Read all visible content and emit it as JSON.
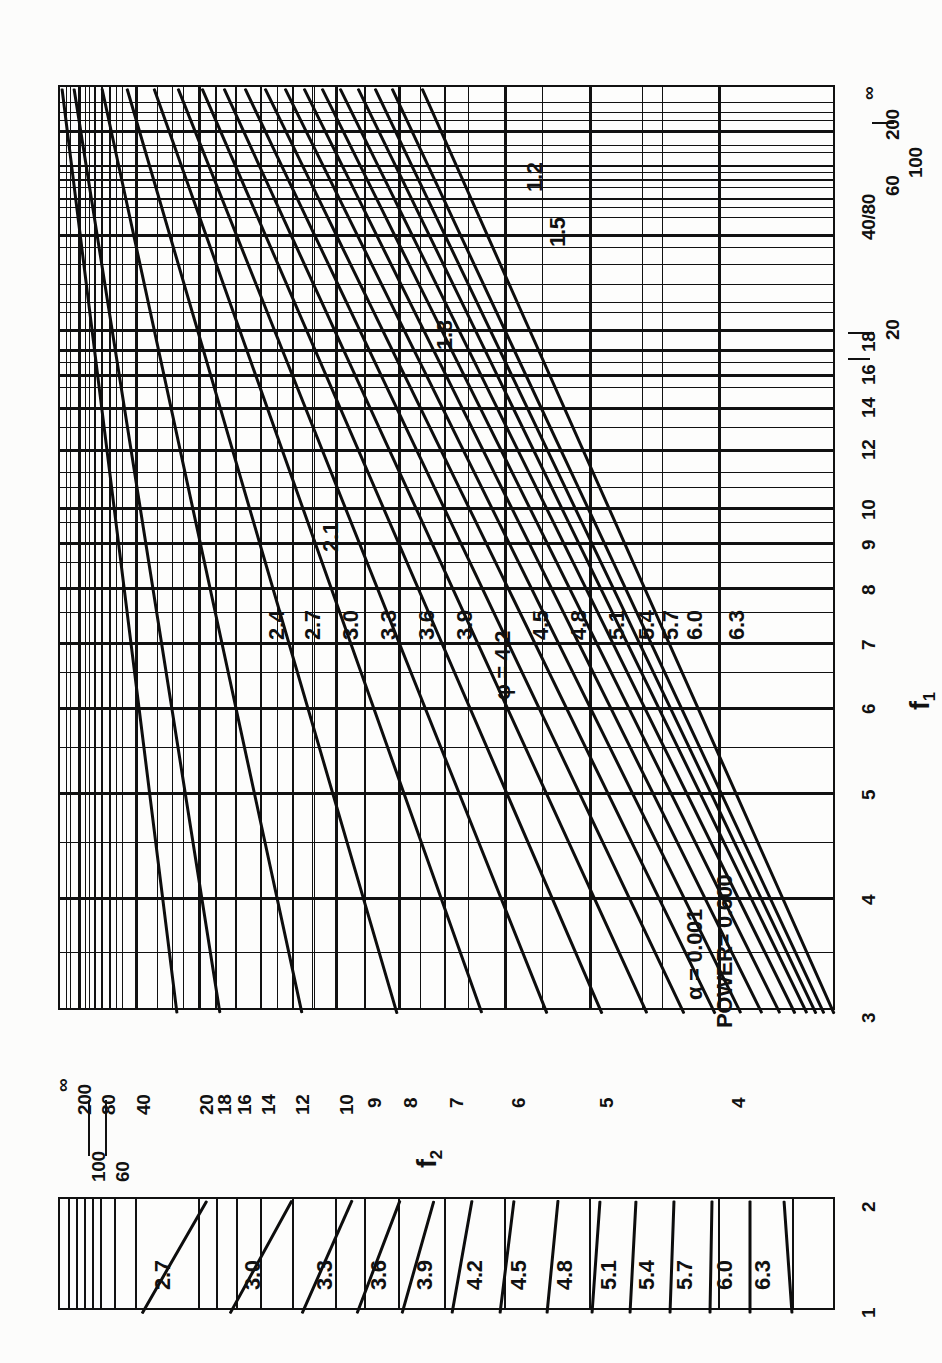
{
  "figure": {
    "kind": "pearson-hartley-power-chart",
    "orientation": "rotated-90-ccw",
    "background_color": "#fcfcfb",
    "ink_color": "#111111"
  },
  "annotations": {
    "alpha_label": "α  = 0.001",
    "power_label": "POWER= 0.600",
    "phi_label": "φ = 4.2"
  },
  "axes": {
    "x_axis_title": "f",
    "x_axis_subscript": "1",
    "y_axis_title": "f",
    "y_axis_subscript": "2",
    "x_ticks": [
      "3",
      "4",
      "5",
      "6",
      "7",
      "8",
      "9",
      "10",
      "12",
      "14",
      "16",
      "18",
      "20",
      "40",
      "60",
      "80",
      "100",
      "200",
      "∞"
    ],
    "x_tick_group_40_80": "40/80",
    "y_ticks": [
      "∞",
      "200",
      "100",
      "80",
      "60",
      "40",
      "20",
      "18",
      "16",
      "14",
      "12",
      "10",
      "9",
      "8",
      "7",
      "6",
      "5",
      "4"
    ],
    "sub_panel_x_ticks": [
      "1",
      "2"
    ]
  },
  "chart_data": {
    "type": "line",
    "title": "",
    "subtitle": "",
    "xlabel": "f₁",
    "ylabel": "f₂",
    "grid": true,
    "legend_position": "inline-curve-labels",
    "xlim": [
      3,
      200
    ],
    "ylim": [
      4,
      200
    ],
    "x_scale": "reciprocal-nonlinear",
    "y_scale": "reciprocal-nonlinear",
    "annotation_alpha": 0.001,
    "annotation_power": 0.6,
    "main_panel": {
      "curve_variable": "φ",
      "curve_labels": [
        "1.2",
        "1.5",
        "1.8",
        "2.1",
        "2.4",
        "2.7",
        "3.0",
        "3.3",
        "3.6",
        "3.9",
        "4.2",
        "4.5",
        "4.8",
        "5.1",
        "5.4",
        "5.7",
        "6.0",
        "6.3"
      ],
      "curve_values": [
        1.2,
        1.5,
        1.8,
        2.1,
        2.4,
        2.7,
        3.0,
        3.3,
        3.6,
        3.9,
        4.2,
        4.5,
        4.8,
        5.1,
        5.4,
        5.7,
        6.0,
        6.3
      ]
    },
    "sub_panel": {
      "curve_variable": "φ",
      "x_range": [
        1,
        2
      ],
      "curve_labels": [
        "2.7",
        "3.0",
        "3.3",
        "3.6",
        "3.9",
        "4.2",
        "4.5",
        "4.8",
        "5.1",
        "5.4",
        "5.7",
        "6.0",
        "6.3"
      ],
      "curve_values": [
        2.7,
        3.0,
        3.3,
        3.6,
        3.9,
        4.2,
        4.5,
        4.8,
        5.1,
        5.4,
        5.7,
        6.0,
        6.3
      ]
    }
  },
  "main_curve_labels": {
    "l0": "1.2",
    "l1": "1.5",
    "l2": "1.8",
    "l3": "2.1",
    "l4": "2.4",
    "l5": "2.7",
    "l6": "3.0",
    "l7": "3.3",
    "l8": "3.6",
    "l9": "3.9",
    "l10": "4.5",
    "l11": "4.8",
    "l12": "5.1",
    "l13": "5.4",
    "l14": "5.7",
    "l15": "6.0",
    "l16": "6.3"
  },
  "sub_curve_labels": {
    "s0": "2.7",
    "s1": "3.0",
    "s2": "3.3",
    "s3": "3.6",
    "s4": "3.9",
    "s5": "4.2",
    "s6": "4.5",
    "s7": "4.8",
    "s8": "5.1",
    "s9": "5.4",
    "s10": "5.7",
    "s11": "6.0",
    "s12": "6.3"
  },
  "x_tick_labels": {
    "t3": "3",
    "t4": "4",
    "t5": "5",
    "t6": "6",
    "t7": "7",
    "t8": "8",
    "t9": "9",
    "t10": "10",
    "t12": "12",
    "t14": "14",
    "t16": "16",
    "t18": "18",
    "t20": "20",
    "t4080": "40/80",
    "t60": "60",
    "t100": "100",
    "t200": "200",
    "tinf": "∞"
  },
  "y_tick_labels": {
    "yinf": "∞",
    "y200": "200",
    "y100": "100",
    "y80": "80",
    "y60": "60",
    "y40": "40",
    "y20": "20",
    "y18": "18",
    "y16": "16",
    "y14": "14",
    "y12": "12",
    "y10": "10",
    "y9": "9",
    "y8": "8",
    "y7": "7",
    "y6": "6",
    "y5": "5",
    "y4": "4"
  },
  "sub_axis_labels": {
    "left": "1",
    "right": "2"
  }
}
